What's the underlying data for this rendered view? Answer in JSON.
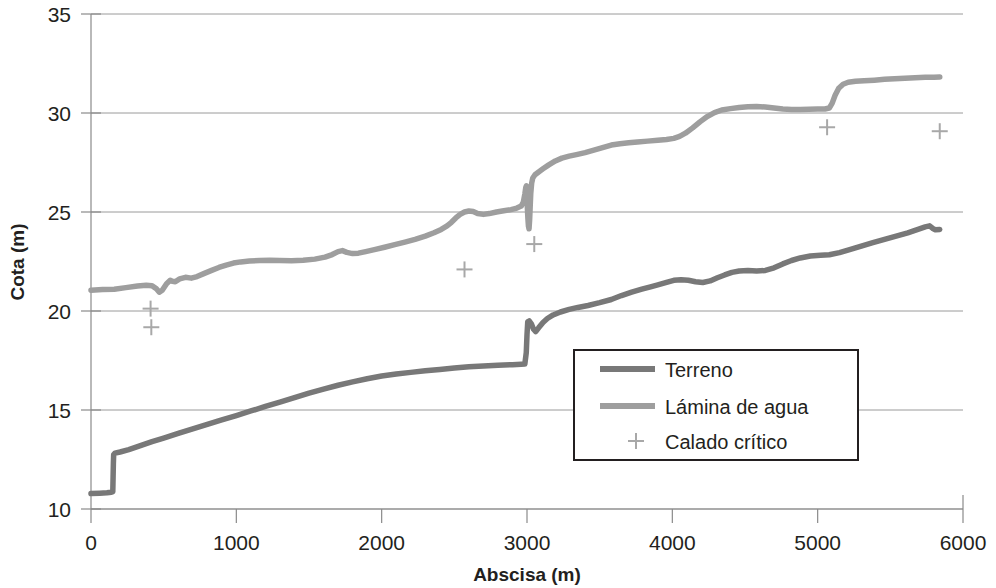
{
  "chart_data": {
    "type": "line",
    "title": "",
    "xlabel": "Abscisa (m)",
    "ylabel": "Cota (m)",
    "xlim": [
      0,
      6000
    ],
    "ylim": [
      10,
      35
    ],
    "xticks": [
      0,
      1000,
      2000,
      3000,
      4000,
      5000,
      6000
    ],
    "yticks": [
      10,
      15,
      20,
      25,
      30,
      35
    ],
    "xtick_labels": [
      "0",
      "1000",
      "2000",
      "3000",
      "4000",
      "5000",
      "6000"
    ],
    "ytick_labels": [
      "10",
      "15",
      "20",
      "25",
      "30",
      "35"
    ],
    "grid": "horizontal",
    "legend_position": "center-right-inside",
    "colors": {
      "terreno": "#787878",
      "lamina": "#9e9e9e",
      "calado": "#a8a8a8",
      "grid": "#9a9a9a",
      "axis": "#8a8a8a",
      "text": "#231f20"
    },
    "series": [
      {
        "name": "Terreno",
        "type": "line",
        "color": "#787878",
        "points": [
          [
            0,
            10.78
          ],
          [
            60,
            10.8
          ],
          [
            110,
            10.82
          ],
          [
            140,
            10.85
          ],
          [
            150,
            10.88
          ],
          [
            152,
            11.6
          ],
          [
            154,
            12.3
          ],
          [
            156,
            12.75
          ],
          [
            165,
            12.82
          ],
          [
            200,
            12.88
          ],
          [
            260,
            13.0
          ],
          [
            340,
            13.2
          ],
          [
            420,
            13.4
          ],
          [
            500,
            13.58
          ],
          [
            600,
            13.82
          ],
          [
            700,
            14.05
          ],
          [
            800,
            14.28
          ],
          [
            900,
            14.5
          ],
          [
            1000,
            14.72
          ],
          [
            1100,
            14.95
          ],
          [
            1200,
            15.18
          ],
          [
            1300,
            15.4
          ],
          [
            1400,
            15.62
          ],
          [
            1500,
            15.85
          ],
          [
            1600,
            16.05
          ],
          [
            1700,
            16.25
          ],
          [
            1800,
            16.42
          ],
          [
            1900,
            16.58
          ],
          [
            2000,
            16.72
          ],
          [
            2100,
            16.82
          ],
          [
            2200,
            16.9
          ],
          [
            2300,
            16.98
          ],
          [
            2400,
            17.05
          ],
          [
            2500,
            17.12
          ],
          [
            2600,
            17.18
          ],
          [
            2700,
            17.22
          ],
          [
            2800,
            17.26
          ],
          [
            2900,
            17.29
          ],
          [
            2960,
            17.31
          ],
          [
            2985,
            17.32
          ],
          [
            2995,
            17.9
          ],
          [
            3000,
            18.8
          ],
          [
            3005,
            19.45
          ],
          [
            3015,
            19.5
          ],
          [
            3030,
            19.35
          ],
          [
            3045,
            19.08
          ],
          [
            3060,
            18.96
          ],
          [
            3080,
            19.15
          ],
          [
            3110,
            19.42
          ],
          [
            3140,
            19.62
          ],
          [
            3180,
            19.8
          ],
          [
            3230,
            19.95
          ],
          [
            3290,
            20.08
          ],
          [
            3350,
            20.18
          ],
          [
            3420,
            20.28
          ],
          [
            3500,
            20.42
          ],
          [
            3580,
            20.58
          ],
          [
            3650,
            20.78
          ],
          [
            3720,
            20.95
          ],
          [
            3790,
            21.1
          ],
          [
            3850,
            21.22
          ],
          [
            3900,
            21.32
          ],
          [
            3960,
            21.45
          ],
          [
            4010,
            21.55
          ],
          [
            4060,
            21.58
          ],
          [
            4110,
            21.55
          ],
          [
            4160,
            21.48
          ],
          [
            4210,
            21.44
          ],
          [
            4260,
            21.52
          ],
          [
            4310,
            21.68
          ],
          [
            4360,
            21.82
          ],
          [
            4410,
            21.95
          ],
          [
            4460,
            22.02
          ],
          [
            4520,
            22.05
          ],
          [
            4580,
            22.02
          ],
          [
            4640,
            22.05
          ],
          [
            4700,
            22.18
          ],
          [
            4760,
            22.38
          ],
          [
            4820,
            22.55
          ],
          [
            4880,
            22.68
          ],
          [
            4950,
            22.78
          ],
          [
            5020,
            22.82
          ],
          [
            5080,
            22.84
          ],
          [
            5150,
            22.95
          ],
          [
            5220,
            23.1
          ],
          [
            5300,
            23.28
          ],
          [
            5380,
            23.45
          ],
          [
            5460,
            23.62
          ],
          [
            5540,
            23.78
          ],
          [
            5620,
            23.95
          ],
          [
            5690,
            24.12
          ],
          [
            5740,
            24.25
          ],
          [
            5770,
            24.3
          ],
          [
            5790,
            24.18
          ],
          [
            5810,
            24.1
          ],
          [
            5840,
            24.12
          ]
        ]
      },
      {
        "name": "Lámina de agua",
        "type": "line",
        "color": "#9e9e9e",
        "points": [
          [
            0,
            21.05
          ],
          [
            80,
            21.08
          ],
          [
            160,
            21.1
          ],
          [
            240,
            21.18
          ],
          [
            320,
            21.26
          ],
          [
            380,
            21.3
          ],
          [
            420,
            21.28
          ],
          [
            450,
            21.12
          ],
          [
            470,
            20.95
          ],
          [
            490,
            21.05
          ],
          [
            520,
            21.38
          ],
          [
            545,
            21.55
          ],
          [
            560,
            21.5
          ],
          [
            580,
            21.48
          ],
          [
            610,
            21.62
          ],
          [
            650,
            21.7
          ],
          [
            690,
            21.66
          ],
          [
            730,
            21.74
          ],
          [
            780,
            21.9
          ],
          [
            830,
            22.05
          ],
          [
            880,
            22.2
          ],
          [
            930,
            22.32
          ],
          [
            980,
            22.42
          ],
          [
            1030,
            22.48
          ],
          [
            1090,
            22.52
          ],
          [
            1160,
            22.55
          ],
          [
            1230,
            22.56
          ],
          [
            1300,
            22.55
          ],
          [
            1380,
            22.54
          ],
          [
            1460,
            22.56
          ],
          [
            1540,
            22.62
          ],
          [
            1610,
            22.72
          ],
          [
            1660,
            22.85
          ],
          [
            1700,
            23.0
          ],
          [
            1730,
            23.05
          ],
          [
            1760,
            22.96
          ],
          [
            1800,
            22.9
          ],
          [
            1840,
            22.92
          ],
          [
            1890,
            23.0
          ],
          [
            1950,
            23.1
          ],
          [
            2020,
            23.22
          ],
          [
            2090,
            23.35
          ],
          [
            2160,
            23.48
          ],
          [
            2230,
            23.62
          ],
          [
            2300,
            23.78
          ],
          [
            2360,
            23.95
          ],
          [
            2410,
            24.12
          ],
          [
            2450,
            24.3
          ],
          [
            2480,
            24.48
          ],
          [
            2510,
            24.7
          ],
          [
            2540,
            24.88
          ],
          [
            2570,
            25.0
          ],
          [
            2600,
            25.05
          ],
          [
            2630,
            25.02
          ],
          [
            2660,
            24.92
          ],
          [
            2700,
            24.88
          ],
          [
            2740,
            24.92
          ],
          [
            2790,
            25.0
          ],
          [
            2840,
            25.06
          ],
          [
            2890,
            25.12
          ],
          [
            2930,
            25.2
          ],
          [
            2960,
            25.3
          ],
          [
            2975,
            25.5
          ],
          [
            2985,
            25.9
          ],
          [
            2992,
            26.25
          ],
          [
            2996,
            26.32
          ],
          [
            2999,
            25.9
          ],
          [
            3002,
            25.3
          ],
          [
            3006,
            24.7
          ],
          [
            3010,
            24.28
          ],
          [
            3014,
            24.15
          ],
          [
            3018,
            24.6
          ],
          [
            3022,
            25.3
          ],
          [
            3026,
            25.95
          ],
          [
            3032,
            26.45
          ],
          [
            3040,
            26.72
          ],
          [
            3055,
            26.88
          ],
          [
            3080,
            27.02
          ],
          [
            3110,
            27.18
          ],
          [
            3150,
            27.38
          ],
          [
            3195,
            27.58
          ],
          [
            3240,
            27.72
          ],
          [
            3290,
            27.82
          ],
          [
            3340,
            27.9
          ],
          [
            3400,
            28.0
          ],
          [
            3460,
            28.12
          ],
          [
            3520,
            28.25
          ],
          [
            3580,
            28.38
          ],
          [
            3640,
            28.45
          ],
          [
            3700,
            28.5
          ],
          [
            3760,
            28.54
          ],
          [
            3830,
            28.58
          ],
          [
            3900,
            28.62
          ],
          [
            3960,
            28.66
          ],
          [
            4010,
            28.72
          ],
          [
            4050,
            28.82
          ],
          [
            4090,
            28.98
          ],
          [
            4140,
            29.25
          ],
          [
            4190,
            29.55
          ],
          [
            4240,
            29.82
          ],
          [
            4290,
            30.02
          ],
          [
            4340,
            30.15
          ],
          [
            4400,
            30.22
          ],
          [
            4460,
            30.28
          ],
          [
            4520,
            30.32
          ],
          [
            4580,
            30.33
          ],
          [
            4640,
            30.3
          ],
          [
            4700,
            30.25
          ],
          [
            4760,
            30.2
          ],
          [
            4820,
            30.18
          ],
          [
            4880,
            30.18
          ],
          [
            4940,
            30.19
          ],
          [
            5000,
            30.2
          ],
          [
            5050,
            30.2
          ],
          [
            5080,
            30.25
          ],
          [
            5100,
            30.5
          ],
          [
            5120,
            30.9
          ],
          [
            5145,
            31.25
          ],
          [
            5175,
            31.45
          ],
          [
            5210,
            31.55
          ],
          [
            5260,
            31.6
          ],
          [
            5320,
            31.63
          ],
          [
            5390,
            31.66
          ],
          [
            5460,
            31.7
          ],
          [
            5530,
            31.73
          ],
          [
            5600,
            31.76
          ],
          [
            5670,
            31.78
          ],
          [
            5740,
            31.8
          ],
          [
            5800,
            31.81
          ],
          [
            5840,
            31.82
          ]
        ]
      },
      {
        "name": "Calado crítico",
        "type": "scatter",
        "marker": "plus",
        "color": "#a8a8a8",
        "points": [
          [
            410,
            20.12
          ],
          [
            415,
            19.18
          ],
          [
            2570,
            22.1
          ],
          [
            3050,
            23.38
          ],
          [
            5065,
            29.28
          ],
          [
            5840,
            29.08
          ]
        ]
      }
    ]
  },
  "legend": {
    "entries": [
      {
        "label": "Terreno",
        "type": "line",
        "color": "#787878"
      },
      {
        "label": "Lámina de agua",
        "type": "line",
        "color": "#9e9e9e"
      },
      {
        "label": "Calado crítico",
        "type": "marker",
        "color": "#a8a8a8"
      }
    ]
  }
}
